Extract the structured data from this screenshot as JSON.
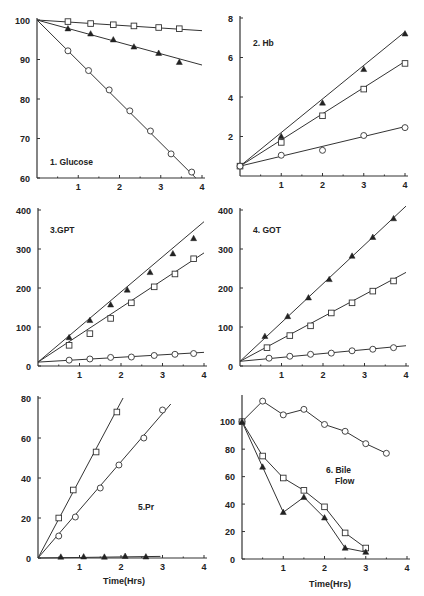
{
  "figure": {
    "x_axis_title": "Time(Hrs)"
  },
  "chart_data": [
    {
      "id": "p1",
      "type": "line",
      "title": "1. Glucose",
      "xlabel": "",
      "ylabel": "",
      "xlim": [
        0,
        4
      ],
      "ylim": [
        60,
        100
      ],
      "xticks": [
        1,
        2,
        3,
        4
      ],
      "yticks": [
        60,
        70,
        80,
        90,
        100
      ],
      "box": {
        "x0": 37,
        "x1": 202,
        "y0": 178,
        "y1": 20
      },
      "title_pos": [
        50,
        165
      ],
      "grid": false,
      "series": [
        {
          "name": "open square",
          "marker": "square",
          "fit": "line",
          "fit_points": [
            [
              0,
              100
            ],
            [
              4,
              97.3
            ]
          ],
          "points": [
            [
              0.75,
              99.6
            ],
            [
              1.3,
              99.1
            ],
            [
              1.85,
              98.8
            ],
            [
              2.35,
              98.5
            ],
            [
              2.95,
              98.1
            ],
            [
              3.45,
              97.8
            ]
          ]
        },
        {
          "name": "filled triangle",
          "marker": "triangle",
          "fit": "line",
          "fit_points": [
            [
              0,
              100
            ],
            [
              4,
              88.6
            ]
          ],
          "points": [
            [
              0.75,
              97.8
            ],
            [
              1.3,
              96.5
            ],
            [
              1.85,
              95.0
            ],
            [
              2.35,
              93.2
            ],
            [
              2.95,
              91.6
            ],
            [
              3.45,
              89.3
            ]
          ]
        },
        {
          "name": "open circle",
          "marker": "circle",
          "fit": "line",
          "fit_points": [
            [
              0,
              100
            ],
            [
              3.85,
              60
            ]
          ],
          "points": [
            [
              0.75,
              92.2
            ],
            [
              1.25,
              87.2
            ],
            [
              1.75,
              82.3
            ],
            [
              2.25,
              77.0
            ],
            [
              2.75,
              71.9
            ],
            [
              3.25,
              66.1
            ],
            [
              3.75,
              61.5
            ]
          ]
        }
      ]
    },
    {
      "id": "p2",
      "type": "line",
      "title": "2. Hb",
      "xlabel": "",
      "ylabel": "",
      "xlim": [
        0,
        4
      ],
      "ylim": [
        0,
        8
      ],
      "xticks": [
        1,
        2,
        3,
        4
      ],
      "yticks": [
        2,
        4,
        6,
        8
      ],
      "box": {
        "x0": 240,
        "x1": 405,
        "y0": 176,
        "y1": 18
      },
      "title_pos": [
        253,
        46
      ],
      "grid": false,
      "series": [
        {
          "name": "filled triangle",
          "marker": "triangle",
          "fit": "line",
          "fit_points": [
            [
              0,
              0.5
            ],
            [
              4,
              7.3
            ]
          ],
          "points": [
            [
              0,
              0.5
            ],
            [
              1,
              2.0
            ],
            [
              2,
              3.7
            ],
            [
              3,
              5.4
            ],
            [
              4,
              7.2
            ]
          ]
        },
        {
          "name": "open square",
          "marker": "square",
          "fit": "line",
          "fit_points": [
            [
              0,
              0.5
            ],
            [
              4,
              5.8
            ]
          ],
          "points": [
            [
              0,
              0.5
            ],
            [
              1,
              1.7
            ],
            [
              2,
              3.05
            ],
            [
              3,
              4.4
            ],
            [
              4,
              5.7
            ]
          ]
        },
        {
          "name": "open circle",
          "marker": "circle",
          "fit": "line",
          "fit_points": [
            [
              0,
              0.5
            ],
            [
              4,
              2.5
            ]
          ],
          "points": [
            [
              0,
              0.5
            ],
            [
              1,
              1.05
            ],
            [
              2,
              1.3
            ],
            [
              3,
              2.05
            ],
            [
              4,
              2.45
            ]
          ]
        }
      ]
    },
    {
      "id": "p3",
      "type": "line",
      "title": "3.GPT",
      "xlabel": "",
      "ylabel": "",
      "xlim": [
        0,
        4
      ],
      "ylim": [
        0,
        400
      ],
      "xticks": [
        1,
        2,
        3,
        4
      ],
      "yticks": [
        0,
        100,
        200,
        300,
        400
      ],
      "box": {
        "x0": 38,
        "x1": 204,
        "y0": 366,
        "y1": 210
      },
      "title_pos": [
        50,
        233
      ],
      "grid": false,
      "series": [
        {
          "name": "filled triangle",
          "marker": "triangle",
          "fit": "line",
          "fit_points": [
            [
              0,
              10
            ],
            [
              4,
              370
            ]
          ],
          "points": [
            [
              0.75,
              73
            ],
            [
              1.25,
              117
            ],
            [
              1.75,
              157
            ],
            [
              2.15,
              195
            ],
            [
              2.7,
              240
            ],
            [
              3.25,
              288
            ],
            [
              3.75,
              327
            ]
          ]
        },
        {
          "name": "open square",
          "marker": "square",
          "fit": "line",
          "fit_points": [
            [
              0,
              10
            ],
            [
              4,
              290
            ]
          ],
          "points": [
            [
              0.75,
              53
            ],
            [
              1.25,
              83
            ],
            [
              1.75,
              122
            ],
            [
              2.25,
              162
            ],
            [
              2.8,
              203
            ],
            [
              3.3,
              236
            ],
            [
              3.75,
              275
            ]
          ]
        },
        {
          "name": "open circle",
          "marker": "circle",
          "fit": "line",
          "fit_points": [
            [
              0,
              10
            ],
            [
              4,
              35
            ]
          ],
          "points": [
            [
              0.75,
              15
            ],
            [
              1.25,
              18
            ],
            [
              1.75,
              22
            ],
            [
              2.25,
              23
            ],
            [
              2.8,
              27
            ],
            [
              3.3,
              30
            ],
            [
              3.75,
              32
            ]
          ]
        }
      ]
    },
    {
      "id": "p4",
      "type": "line",
      "title": "4. GOT",
      "xlabel": "",
      "ylabel": "",
      "xlim": [
        0,
        4
      ],
      "ylim": [
        0,
        400
      ],
      "xticks": [
        1,
        2,
        3,
        4
      ],
      "yticks": [
        0,
        100,
        200,
        300,
        400
      ],
      "box": {
        "x0": 240,
        "x1": 406,
        "y0": 366,
        "y1": 210
      },
      "title_pos": [
        253,
        233
      ],
      "grid": false,
      "series": [
        {
          "name": "filled triangle",
          "marker": "triangle",
          "fit": "line",
          "fit_points": [
            [
              0,
              12
            ],
            [
              4,
              410
            ]
          ],
          "points": [
            [
              0.6,
              76
            ],
            [
              1.15,
              127
            ],
            [
              1.65,
              175
            ],
            [
              2.15,
              222
            ],
            [
              2.7,
              282
            ],
            [
              3.2,
              330
            ],
            [
              3.7,
              378
            ]
          ]
        },
        {
          "name": "open square",
          "marker": "square",
          "fit": "line",
          "fit_points": [
            [
              0,
              12
            ],
            [
              4,
              240
            ]
          ],
          "points": [
            [
              0.65,
              47
            ],
            [
              1.2,
              78
            ],
            [
              1.7,
              103
            ],
            [
              2.2,
              136
            ],
            [
              2.7,
              162
            ],
            [
              3.2,
              192
            ],
            [
              3.7,
              218
            ]
          ]
        },
        {
          "name": "open circle",
          "marker": "circle",
          "fit": "line",
          "fit_points": [
            [
              0,
              12
            ],
            [
              4,
              52
            ]
          ],
          "points": [
            [
              0.7,
              20
            ],
            [
              1.2,
              25
            ],
            [
              1.7,
              30
            ],
            [
              2.2,
              33
            ],
            [
              2.7,
              39
            ],
            [
              3.2,
              43
            ],
            [
              3.7,
              47
            ]
          ]
        }
      ]
    },
    {
      "id": "p5",
      "type": "line",
      "title": "5.Pr",
      "xlabel": "Time(Hrs)",
      "ylabel": "",
      "xlim": [
        0,
        4
      ],
      "ylim": [
        0,
        80
      ],
      "xticks": [
        1,
        2,
        3,
        4
      ],
      "yticks": [
        0,
        20,
        40,
        60,
        80
      ],
      "box": {
        "x0": 38,
        "x1": 204,
        "y0": 558,
        "y1": 398
      },
      "title_pos": [
        138,
        510
      ],
      "xlabel_pos": [
        124,
        584
      ],
      "grid": false,
      "series": [
        {
          "name": "open square",
          "marker": "square",
          "fit": "line",
          "fit_points": [
            [
              0,
              0
            ],
            [
              2.05,
              80
            ]
          ],
          "points": [
            [
              0.5,
              20
            ],
            [
              0.85,
              34
            ],
            [
              1.4,
              53
            ],
            [
              1.9,
              73
            ]
          ]
        },
        {
          "name": "open circle",
          "marker": "circle",
          "fit": "line",
          "fit_points": [
            [
              0,
              0
            ],
            [
              3.2,
              77
            ]
          ],
          "points": [
            [
              0.5,
              11
            ],
            [
              0.9,
              20.5
            ],
            [
              1.5,
              35
            ],
            [
              1.95,
              46.5
            ],
            [
              2.55,
              60
            ],
            [
              3.0,
              74
            ]
          ]
        },
        {
          "name": "filled triangle",
          "marker": "triangle",
          "fit": "line",
          "fit_points": [
            [
              0,
              0
            ],
            [
              2.95,
              0.8
            ]
          ],
          "points": [
            [
              0.55,
              0.5
            ],
            [
              1.1,
              0.6
            ],
            [
              1.6,
              0.5
            ],
            [
              2.1,
              0.9
            ],
            [
              2.6,
              0.6
            ]
          ]
        }
      ]
    },
    {
      "id": "p6",
      "type": "line",
      "title": "6. Bile",
      "title2": "Flow",
      "xlabel": "Time(Hrs)",
      "ylabel": "",
      "xlim": [
        0,
        4
      ],
      "ylim": [
        0,
        118
      ],
      "xticks": [
        1,
        2,
        3,
        4
      ],
      "yticks": [
        0,
        20,
        40,
        60,
        80,
        100
      ],
      "box": {
        "x0": 242,
        "x1": 407,
        "y0": 559,
        "y1": 397
      },
      "title_pos": [
        326,
        473
      ],
      "title2_pos": [
        335,
        484
      ],
      "xlabel_pos": [
        330,
        587
      ],
      "grid": false,
      "series": [
        {
          "name": "open circle",
          "marker": "circle",
          "fit": "connect",
          "points": [
            [
              0,
              100
            ],
            [
              0.5,
              115
            ],
            [
              1.0,
              105
            ],
            [
              1.5,
              109
            ],
            [
              2.0,
              98
            ],
            [
              2.5,
              93
            ],
            [
              3.0,
              84
            ],
            [
              3.5,
              77
            ]
          ]
        },
        {
          "name": "open square",
          "marker": "square",
          "fit": "connect",
          "points": [
            [
              0,
              100
            ],
            [
              0.5,
              75
            ],
            [
              1.0,
              59
            ],
            [
              1.5,
              50
            ],
            [
              2.0,
              38
            ],
            [
              2.5,
              19
            ],
            [
              3.0,
              8
            ]
          ]
        },
        {
          "name": "filled triangle",
          "marker": "triangle",
          "fit": "connect",
          "points": [
            [
              0,
              100
            ],
            [
              0.5,
              67
            ],
            [
              1.0,
              34
            ],
            [
              1.5,
              45
            ],
            [
              2.0,
              30
            ],
            [
              2.5,
              8
            ],
            [
              3.0,
              5
            ]
          ]
        }
      ]
    }
  ]
}
